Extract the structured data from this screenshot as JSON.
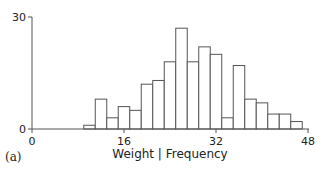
{
  "panel_label": "(a)",
  "chart_data": {
    "type": "bar",
    "title": "",
    "xlabel": "Weight | Frequency",
    "ylabel": "",
    "xlim": [
      0,
      48
    ],
    "ylim": [
      0,
      30
    ],
    "x_ticks": [
      0,
      16,
      32,
      48
    ],
    "y_ticks": [
      0,
      30
    ],
    "grid": false,
    "legend": null,
    "bin_width": 2,
    "bin_edges": [
      9,
      11,
      13,
      15,
      17,
      19,
      21,
      23,
      25,
      27,
      29,
      31,
      33,
      35,
      37,
      39,
      41,
      43,
      45,
      47
    ],
    "values": [
      1,
      8,
      3,
      6,
      5,
      12,
      13,
      18,
      27,
      18,
      22,
      20,
      3,
      17,
      8,
      7,
      4,
      4,
      2
    ],
    "bar_fill": "#ffffff",
    "bar_stroke": "#555555",
    "axis_color": "#555555"
  }
}
